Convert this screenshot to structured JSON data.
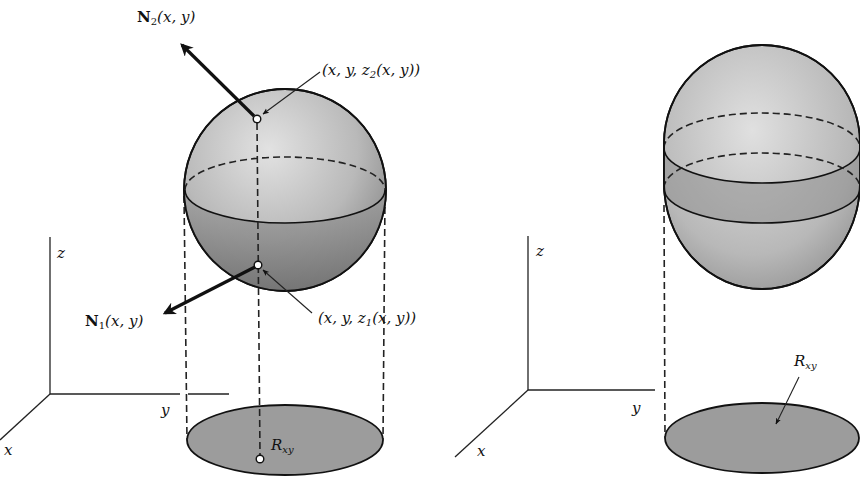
{
  "figure": {
    "colors": {
      "ink": "#111111",
      "surface_light": "#d4d4d4",
      "surface_mid": "#a8a8a8",
      "surface_dark": "#7d7d7d",
      "region_fill": "#9a9a9a",
      "background": "#ffffff"
    },
    "left_panel": {
      "axes": {
        "x_label": "x",
        "y_label": "y",
        "z_label": "z"
      },
      "normal_top": {
        "symbol": "N",
        "subscript": "2",
        "args": "(x, y)"
      },
      "normal_bottom": {
        "symbol": "N",
        "subscript": "1",
        "args": "(x, y)"
      },
      "point_top": {
        "prefix": "(x, y, z",
        "subscript": "2",
        "suffix": "(x, y))"
      },
      "point_bottom": {
        "prefix": "(x, y, z",
        "subscript": "1",
        "suffix": "(x, y))"
      },
      "region": {
        "symbol": "R",
        "subscript": "xy"
      }
    },
    "right_panel": {
      "axes": {
        "x_label": "x",
        "y_label": "y",
        "z_label": "z"
      },
      "region": {
        "symbol": "R",
        "subscript": "xy"
      }
    }
  }
}
